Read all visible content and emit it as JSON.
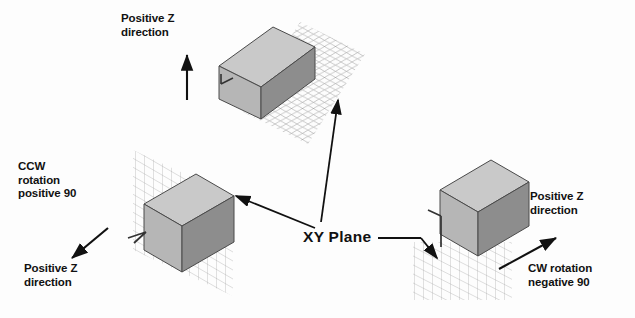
{
  "diagram": {
    "background_color": "#fdfdfd",
    "ink_color": "#111111"
  },
  "center_label": {
    "text": "XY Plane",
    "name": "xy-plane-label"
  },
  "labels": {
    "top_positive_z": "Positive Z\ndirection",
    "left_ccw": "CCW\nrotation\npositive 90",
    "left_positive_z": "Positive Z\ndirection",
    "right_positive_z": "Positive Z\ndirection",
    "right_cw": "CW rotation\nnegative 90"
  },
  "cubes": [
    {
      "id": "top",
      "name": "cube-top-unrotated",
      "plane_orientation": "horizontal",
      "rotation": "none",
      "z_arrow_direction": "up",
      "top_face_color": "#c9c9c9",
      "front_face_color": "#b6b6b6",
      "side_face_color": "#8d8d8d"
    },
    {
      "id": "left",
      "name": "cube-left-ccw-90",
      "plane_orientation": "vertical",
      "rotation": "CCW positive 90",
      "z_arrow_direction": "down-left",
      "top_face_color": "#c9c9c9",
      "front_face_color": "#b6b6b6",
      "side_face_color": "#8d8d8d"
    },
    {
      "id": "right",
      "name": "cube-right-cw-90",
      "plane_orientation": "tilted-below",
      "rotation": "CW negative 90",
      "z_arrow_direction": "up-right",
      "top_face_color": "#c9c9c9",
      "front_face_color": "#b6b6b6",
      "side_face_color": "#8d8d8d"
    }
  ],
  "grid": {
    "line_color": "#9a9a9a",
    "name": "xy-plane-grid"
  }
}
